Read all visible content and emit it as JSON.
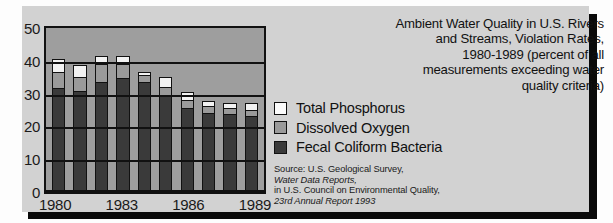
{
  "chart_data": {
    "type": "bar",
    "stacked": true,
    "title_lines": [
      "Ambient Water Quality  in U.S. Rivers",
      "and Streams, Violation Rates,",
      "1980-1989 (percent of all",
      "measurements exceeding water",
      "quality criteria)"
    ],
    "xlabel": "",
    "ylabel": "",
    "ylim": [
      0,
      50
    ],
    "yticks": [
      0,
      10,
      20,
      30,
      40,
      50
    ],
    "grid": true,
    "legend_position": "right",
    "categories": [
      "1980",
      "1981",
      "1982",
      "1983",
      "1984",
      "1985",
      "1986",
      "1987",
      "1988",
      "1989"
    ],
    "visible_tick_labels": [
      "1980",
      "1983",
      "1986",
      "1989"
    ],
    "series": [
      {
        "name": "Fecal Coliform Bacteria",
        "color": "#3a3a3a",
        "values": [
          31,
          30,
          33,
          34,
          33,
          28.5,
          25,
          23.5,
          23,
          22.5
        ]
      },
      {
        "name": "Dissolved Oxygen",
        "color": "#9a9a9a",
        "values": [
          5,
          4.5,
          5.5,
          4.5,
          2,
          3,
          2.5,
          2,
          2,
          2
        ]
      },
      {
        "name": "Total Phosphorus",
        "color": "#f2f2f2",
        "values": [
          4,
          3.5,
          2.5,
          2.5,
          1,
          3,
          2.5,
          1.5,
          1.5,
          2
        ]
      }
    ],
    "totals": [
      40,
      38,
      41,
      41,
      36,
      34.5,
      30,
      27,
      26.5,
      26.5
    ]
  },
  "legend": {
    "items": [
      {
        "label": "Total Phosphorus",
        "swatch": "sw-tp"
      },
      {
        "label": "Dissolved Oxygen",
        "swatch": "sw-do"
      },
      {
        "label": "Fecal Coliform Bacteria",
        "swatch": "sw-fc"
      }
    ]
  },
  "source": {
    "line1": "Source: U.S. Geological Survey,",
    "line2": "Water Data Reports,",
    "line3": "in U.S. Council on Environmental Quality,",
    "line4": "23rd Annual Report 1993"
  },
  "colors": {
    "card_background": "#d2d2d2",
    "plot_background": "#9e9e9e",
    "ink": "#111111"
  }
}
